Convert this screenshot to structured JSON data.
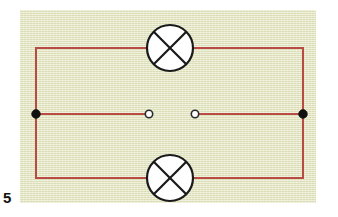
{
  "figure": {
    "number_label": "5",
    "caption": "",
    "panel": {
      "x": 20,
      "y": 10,
      "width": 296,
      "height": 193,
      "background_color": "#e7e8c6",
      "texture": "horizontal-lined-paper"
    }
  },
  "circuit": {
    "title": "Two lamps in parallel with an open switch gap",
    "wire_color": "#b84b44",
    "wire_width": 2,
    "symbol_stroke_color": "#1a1a1a",
    "symbol_fill_color": "#ffffff",
    "junction_fill_color": "#111111",
    "terminal_fill_color": "#ffffff",
    "geometry": {
      "left_rail_x": 36,
      "right_rail_x": 303,
      "top_branch_y": 48,
      "middle_branch_y": 114,
      "bottom_branch_y": 178
    },
    "components": [
      {
        "id": "lamp-top",
        "type": "lamp",
        "symbol": "circle-with-x",
        "label": "",
        "cx": 170,
        "cy": 48,
        "r": 23,
        "branch": "top"
      },
      {
        "id": "lamp-bottom",
        "type": "lamp",
        "symbol": "circle-with-x",
        "label": "",
        "cx": 170,
        "cy": 178,
        "r": 23,
        "branch": "bottom"
      },
      {
        "id": "junction-left",
        "type": "junction-dot",
        "symbol": "filled-dot",
        "label": "",
        "cx": 36,
        "cy": 114,
        "r": 4.2
      },
      {
        "id": "junction-right",
        "type": "junction-dot",
        "symbol": "filled-dot",
        "label": "",
        "cx": 303,
        "cy": 114,
        "r": 4.2
      },
      {
        "id": "terminal-left",
        "type": "open-terminal",
        "symbol": "open-circle",
        "label": "",
        "cx": 149,
        "cy": 114,
        "r": 3.6
      },
      {
        "id": "terminal-right",
        "type": "open-terminal",
        "symbol": "open-circle",
        "label": "",
        "cx": 195,
        "cy": 114,
        "r": 3.6
      }
    ],
    "wire_segments": [
      {
        "id": "wire-left-rail",
        "x1": 36,
        "y1": 48,
        "x2": 36,
        "y2": 178
      },
      {
        "id": "wire-right-rail",
        "x1": 303,
        "y1": 48,
        "x2": 303,
        "y2": 178
      },
      {
        "id": "wire-top-left",
        "x1": 36,
        "y1": 48,
        "x2": 147,
        "y2": 48
      },
      {
        "id": "wire-top-right",
        "x1": 193,
        "y1": 48,
        "x2": 303,
        "y2": 48
      },
      {
        "id": "wire-bottom-left",
        "x1": 36,
        "y1": 178,
        "x2": 147,
        "y2": 178
      },
      {
        "id": "wire-bottom-right",
        "x1": 193,
        "y1": 178,
        "x2": 303,
        "y2": 178
      },
      {
        "id": "wire-middle-left",
        "x1": 36,
        "y1": 114,
        "x2": 145,
        "y2": 114
      },
      {
        "id": "wire-middle-right",
        "x1": 199,
        "y1": 114,
        "x2": 303,
        "y2": 114
      }
    ]
  }
}
